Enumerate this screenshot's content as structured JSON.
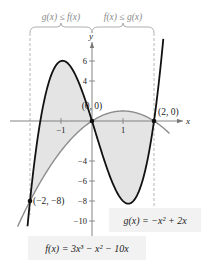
{
  "chart_data": {
    "type": "line",
    "title": "",
    "xlabel": "x",
    "ylabel": "y",
    "xlim": [
      -2.5,
      2.6
    ],
    "ylim": [
      -11,
      8
    ],
    "grid": false,
    "x_ticks": [
      {
        "value": -1,
        "label": "−1"
      },
      {
        "value": 1,
        "label": "1"
      }
    ],
    "y_ticks": [
      {
        "value": 6,
        "label": "6"
      },
      {
        "value": 4,
        "label": "4"
      },
      {
        "value": -4,
        "label": "−4"
      },
      {
        "value": -6,
        "label": "−6"
      },
      {
        "value": -8,
        "label": "−8"
      },
      {
        "value": -10,
        "label": "−10"
      }
    ],
    "series": [
      {
        "name": "f(x) = 3x³ − x² − 10x",
        "coefficients_desc": [
          3,
          -1,
          -10,
          0
        ],
        "domain": [
          -2.08,
          2.3
        ],
        "color": "#111111"
      },
      {
        "name": "g(x) = −x² + 2x",
        "coefficients_desc": [
          -1,
          2,
          0
        ],
        "domain": [
          -2.4,
          2.5
        ],
        "color": "#8c8c8c"
      }
    ],
    "shaded_region": {
      "between": [
        "f",
        "g"
      ],
      "x_range": [
        -2,
        2
      ],
      "color": "#e4e4e4"
    },
    "intersection_points": [
      {
        "x": -2,
        "y": -8,
        "label": "(−2, −8)"
      },
      {
        "x": 0,
        "y": 0,
        "label": "(0, 0)"
      },
      {
        "x": 2,
        "y": 0,
        "label": "(2, 0)"
      }
    ],
    "annotations": {
      "left_interval": {
        "x_range": [
          -2,
          0
        ],
        "label": "g(x) ≤ f(x)"
      },
      "right_interval": {
        "x_range": [
          0,
          2
        ],
        "label": "f(x) ≤ g(x)"
      },
      "f_label": "f(x) = 3x³ − x² − 10x",
      "g_label": "g(x) = −x² + 2x"
    }
  },
  "colors": {
    "f_curve": "#111111",
    "g_curve": "#8c8c8c",
    "shade": "#e4e4e4",
    "axis": "#777777",
    "bracket": "#9a9a9a",
    "label_box": "#f2f2f2"
  }
}
